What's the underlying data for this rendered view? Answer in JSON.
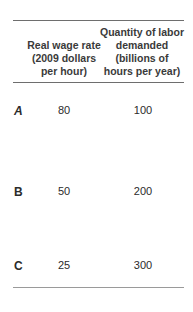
{
  "table": {
    "headers": {
      "col1": "",
      "col2": "Real wage rate (2009 dollars per hour)",
      "col2_lines": [
        "Real wage rate",
        "(2009 dollars",
        "per hour)"
      ],
      "col3": "Quantity of labor demanded (billions of hours per year)",
      "col3_lines": [
        "Quantity of labor",
        "demanded",
        "(billions of",
        "hours per year)"
      ]
    },
    "rows": [
      {
        "label": "A",
        "real_wage_rate": "80",
        "quantity_demanded": "100"
      },
      {
        "label": "B",
        "real_wage_rate": "50",
        "quantity_demanded": "200"
      },
      {
        "label": "C",
        "real_wage_rate": "25",
        "quantity_demanded": "300"
      }
    ]
  }
}
